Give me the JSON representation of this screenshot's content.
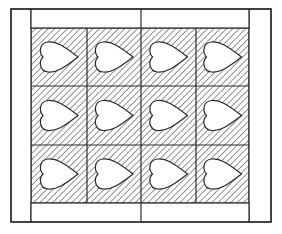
{
  "diagram": {
    "type": "quilt-layout",
    "canvas": {
      "width": 282,
      "height": 234,
      "background": "#ffffff"
    },
    "colors": {
      "line": "#2a2a2a",
      "hatch": "#3a3a3a",
      "fill": "#ffffff"
    },
    "frame": {
      "x": 11,
      "y": 9,
      "width": 260,
      "height": 213
    },
    "borders": {
      "left": {
        "x": 11,
        "y": 9,
        "width": 20,
        "height": 213
      },
      "right": {
        "x": 249,
        "y": 9,
        "width": 22,
        "height": 213
      },
      "top": {
        "x": 31,
        "y": 9,
        "width": 218,
        "height": 19,
        "divider_x": 141
      },
      "bottom": {
        "x": 31,
        "y": 203,
        "width": 218,
        "height": 19,
        "divider_x": 141
      }
    },
    "grid": {
      "x": 31,
      "y": 28,
      "width": 218,
      "height": 175,
      "columns": 4,
      "rows": 3,
      "col_edges": [
        31,
        87,
        141,
        196,
        249
      ],
      "row_edges": [
        28,
        86,
        145,
        203
      ],
      "hatch": {
        "direction": "diagonal-down-right",
        "spacing": 4.5
      }
    },
    "block_motif": "heart",
    "heart_orientation": "pointing-right",
    "blocks": [
      {
        "row": 0,
        "col": 0,
        "motif": "heart"
      },
      {
        "row": 0,
        "col": 1,
        "motif": "heart"
      },
      {
        "row": 0,
        "col": 2,
        "motif": "heart"
      },
      {
        "row": 0,
        "col": 3,
        "motif": "heart"
      },
      {
        "row": 1,
        "col": 0,
        "motif": "heart"
      },
      {
        "row": 1,
        "col": 1,
        "motif": "heart"
      },
      {
        "row": 1,
        "col": 2,
        "motif": "heart"
      },
      {
        "row": 1,
        "col": 3,
        "motif": "heart"
      },
      {
        "row": 2,
        "col": 0,
        "motif": "heart"
      },
      {
        "row": 2,
        "col": 1,
        "motif": "heart"
      },
      {
        "row": 2,
        "col": 2,
        "motif": "heart"
      },
      {
        "row": 2,
        "col": 3,
        "motif": "heart"
      }
    ]
  }
}
